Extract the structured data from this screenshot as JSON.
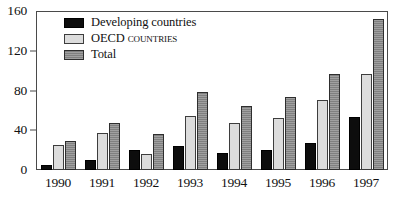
{
  "chart_data": {
    "type": "bar",
    "title": "",
    "subtitle": "",
    "xlabel": "",
    "ylabel": "",
    "categories": [
      "1990",
      "1991",
      "1992",
      "1993",
      "1994",
      "1995",
      "1996",
      "1997"
    ],
    "series": [
      {
        "name": "Developing countries",
        "key": "developing",
        "color": "#0d0d0d",
        "values": [
          5,
          10,
          20,
          24,
          17,
          20,
          27,
          53
        ]
      },
      {
        "name": "OECD countries",
        "key": "oecd",
        "color": "#dcdcdc",
        "values": [
          25,
          37,
          16,
          54,
          47,
          52,
          70,
          97
        ]
      },
      {
        "name": "Total",
        "key": "total",
        "color": "#8e8e8e",
        "values": [
          29,
          47,
          36,
          79,
          64,
          73,
          97,
          152
        ]
      }
    ],
    "ylim": [
      0,
      160
    ],
    "yticks": [
      0,
      40,
      80,
      120,
      160
    ],
    "ytick_labels": [
      "0",
      "40",
      "80",
      "120",
      "160"
    ],
    "grid": false,
    "legend_position": "top-left",
    "annotations": []
  },
  "legend": {
    "items": [
      {
        "label": "Developing countries",
        "swatch": "developing",
        "smallcaps": false
      },
      {
        "label": "OECD countries",
        "swatch": "oecd",
        "smallcaps": true
      },
      {
        "label": "Total",
        "swatch": "total",
        "smallcaps": false
      }
    ]
  }
}
